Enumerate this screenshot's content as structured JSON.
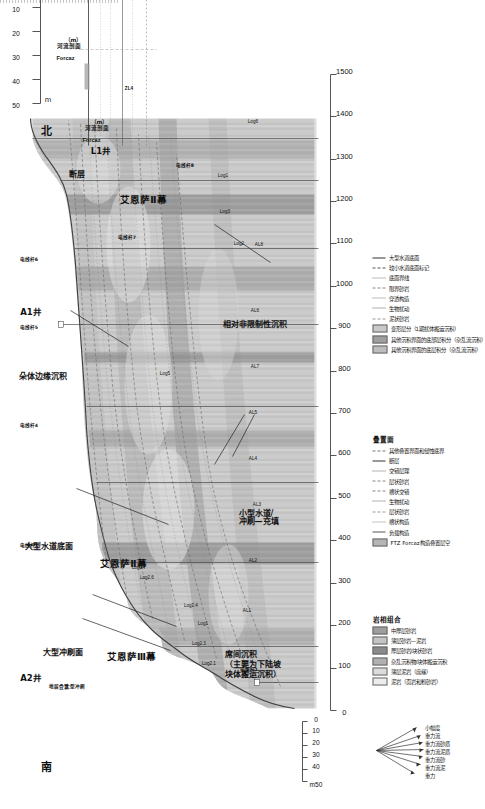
{
  "figure": {
    "type": "geological-cross-section",
    "orientation_labels": {
      "south": "南",
      "north": "北"
    },
    "colors": {
      "background_fill": "#d9d9d9",
      "channel_fill": "#bfbfbf",
      "dark_band": "#8c8c8c",
      "mid_band": "#a6a6a6",
      "light_band": "#e8e8e8",
      "line": "#4d4d4d",
      "axis": "#555555"
    }
  },
  "horizontal_axis": {
    "label": "",
    "min": 0,
    "max": 1500,
    "step": 100,
    "ticks": [
      "0",
      "100",
      "200",
      "300",
      "400",
      "500",
      "600",
      "700",
      "800",
      "900",
      "1000",
      "1100",
      "1200",
      "1300",
      "1400",
      "1500"
    ]
  },
  "vertical_scale_left": {
    "unit": "m",
    "unit_prefix": "m50",
    "ticks": [
      "50",
      "40",
      "30",
      "20",
      "10",
      "0"
    ]
  },
  "vertical_scale_right": {
    "unit": "m",
    "ticks": [
      "50",
      "40",
      "30",
      "20",
      "10",
      "0"
    ]
  },
  "wells": [
    {
      "name": "A2井"
    },
    {
      "name": "A1井"
    },
    {
      "name": "L1井"
    }
  ],
  "outcrop_columns": [
    {
      "name": "电线杆1"
    },
    {
      "name": "电线杆3"
    },
    {
      "name": "电线杆4"
    },
    {
      "name": "电线杆5"
    },
    {
      "name": "电线杆6"
    },
    {
      "name": "电线杆7"
    },
    {
      "name": "电线杆8"
    }
  ],
  "log_labels": [
    "Log2.1",
    "Log2.3",
    "Log1",
    "Log2.4",
    "Log2.6",
    "Log2.7",
    "Log5",
    "Log3",
    "Log2",
    "Log1",
    "Log6"
  ],
  "surface_labels": [
    "AL1",
    "AL2",
    "AL3",
    "AL4",
    "AL5",
    "AL6",
    "AL7",
    "AL8"
  ],
  "annotations": [
    {
      "id": "unit-3",
      "text": "艾恩萨Ⅲ幕"
    },
    {
      "id": "unit-2-mid",
      "text": "艾恩萨Ⅱ幕"
    },
    {
      "id": "unit-2-north",
      "text": "艾恩萨Ⅱ幕"
    },
    {
      "id": "fault",
      "text": "断层"
    },
    {
      "id": "erosion-surface",
      "text": "大型冲刷面"
    },
    {
      "id": "strata-stack",
      "text": "地层叠置"
    },
    {
      "id": "big-erosion",
      "text": "大型冲刷"
    },
    {
      "id": "channel-base",
      "text": "大型水道底面"
    },
    {
      "id": "small-channel",
      "text": "小型水道/\n冲刷—充填"
    },
    {
      "id": "lobe-fringe",
      "text": "朵体边缘沉积"
    },
    {
      "id": "unconfined",
      "text": "相对非限制性沉积"
    },
    {
      "id": "interlobe",
      "text": "席间沉积\n（主要为下陆坡\n块体搬运沉积）"
    }
  ],
  "well_header": {
    "name": "L1井",
    "line1": "Forcaz",
    "line2": "河流剖面",
    "line3": "（m）",
    "marker": "ZL4",
    "inset_name": "Forcaz",
    "inset_line2": "河流剖面",
    "inset_line3": "（m）"
  },
  "legend_lithofacies": {
    "title": "岩相组合",
    "items": [
      {
        "label": "中厚层砂岩",
        "color": "#9e9e9e"
      },
      {
        "label": "薄层砂岩—泥岩",
        "color": "#c4c4c4"
      },
      {
        "label": "厚层砂岩/块状砂岩",
        "color": "#8a8a8a"
      },
      {
        "label": "杂乱沉积物/块体搬运沉积",
        "color": "#b0b0b0"
      },
      {
        "label": "薄层泥岩（席缘）",
        "color": "#dcdcdc"
      },
      {
        "label": "泥岩（页岩和粉砂岩）",
        "color": "#ededed"
      }
    ]
  },
  "legend_surfaces": {
    "title": "叠置面",
    "items": [
      {
        "label": "其他叠置界面和侵蚀底界",
        "style": "dash",
        "color": "#777777"
      },
      {
        "label": "断层",
        "style": "solid",
        "color": "#333333"
      },
      {
        "label": "交错层理",
        "style": "dot",
        "color": "#666666"
      },
      {
        "label": "层状砂岩",
        "style": "dash",
        "color": "#888888"
      },
      {
        "label": "槽状交错",
        "style": "dash",
        "color": "#888888"
      },
      {
        "label": "生物扰动",
        "style": "dot",
        "color": "#666666"
      },
      {
        "label": "层状砂岩",
        "style": "dash",
        "color": "#999999"
      },
      {
        "label": "槽状构造",
        "style": "dot",
        "color": "#888888"
      },
      {
        "label": "负载构造",
        "style": "solid",
        "color": "#555555"
      },
      {
        "label": "FTZ Forcaz构造叠置层空",
        "style": "fill",
        "color": "#b5b5b5"
      }
    ]
  },
  "legend_right": {
    "items": [
      {
        "label": "大型水道底面"
      },
      {
        "label": "较小水道底面标记"
      },
      {
        "label": "底面界线"
      },
      {
        "label": "限界砂岩"
      },
      {
        "label": "穿透构造"
      },
      {
        "label": "生物扰动"
      },
      {
        "label": "泥状砂岩"
      },
      {
        "label": "变形层分（1期扰体搬运沉积）"
      },
      {
        "label": "其他沉积界面的底部层积分（杂乱流沉积）"
      },
      {
        "label": "其他沉积界面的底层积分（杂乱流沉积）"
      }
    ]
  },
  "rose_diagram": {
    "rays": [
      "小幅度",
      "重力流",
      "重力流砂质",
      "重力流泥质",
      "重力流砂",
      "重力流泥",
      "重力"
    ]
  }
}
